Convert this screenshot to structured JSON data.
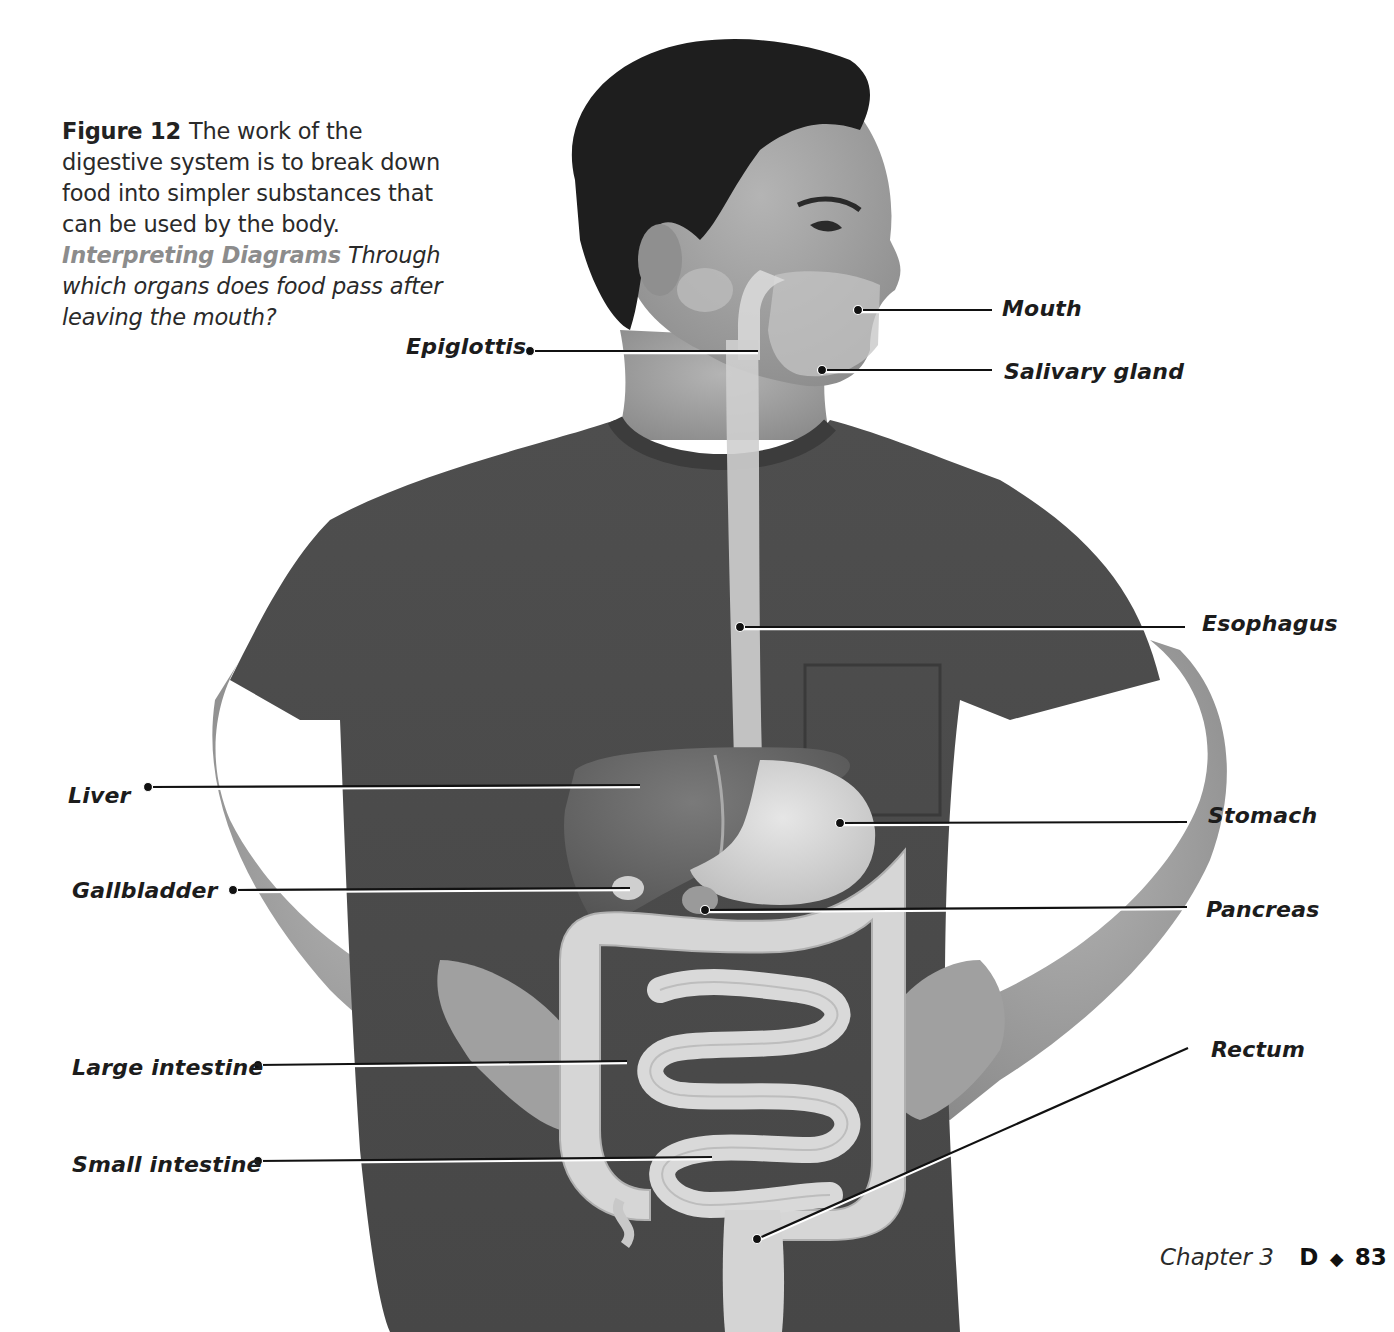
{
  "caption": {
    "figure_number": "Figure 12",
    "text": "The work of the digestive system is to break down food into simpler substances that can be used by the body.",
    "prompt_heading": "Interpreting Diagrams",
    "prompt_text": "Through which organs does food pass after leaving the mouth?"
  },
  "labels": [
    {
      "id": "mouth",
      "text": "Mouth",
      "x": 1002,
      "y": 296,
      "line": {
        "x1": 858,
        "y1": 310,
        "x2": 992,
        "y2": 310
      }
    },
    {
      "id": "epiglottis",
      "text": "Epiglottis",
      "x": 406,
      "y": 334,
      "line": {
        "x1": 530,
        "y1": 351,
        "x2": 758,
        "y2": 351
      }
    },
    {
      "id": "salivary-gland",
      "text": "Salivary gland",
      "x": 1004,
      "y": 359,
      "line": {
        "x1": 822,
        "y1": 370,
        "x2": 992,
        "y2": 370
      }
    },
    {
      "id": "esophagus",
      "text": "Esophagus",
      "x": 1202,
      "y": 611,
      "line": {
        "x1": 740,
        "y1": 627,
        "x2": 1185,
        "y2": 627
      }
    },
    {
      "id": "liver",
      "text": "Liver",
      "x": 68,
      "y": 783,
      "line": {
        "x1": 148,
        "y1": 787,
        "x2": 640,
        "y2": 785
      }
    },
    {
      "id": "stomach",
      "text": "Stomach",
      "x": 1208,
      "y": 803,
      "line": {
        "x1": 840,
        "y1": 823,
        "x2": 1187,
        "y2": 822
      }
    },
    {
      "id": "gallbladder",
      "text": "Gallbladder",
      "x": 72,
      "y": 878,
      "line": {
        "x1": 233,
        "y1": 890,
        "x2": 630,
        "y2": 888
      }
    },
    {
      "id": "pancreas",
      "text": "Pancreas",
      "x": 1206,
      "y": 897,
      "line": {
        "x1": 705,
        "y1": 910,
        "x2": 1187,
        "y2": 907
      }
    },
    {
      "id": "rectum",
      "text": "Rectum",
      "x": 1211,
      "y": 1037,
      "line": {
        "x1": 757,
        "y1": 1239,
        "x2": 1188,
        "y2": 1048
      }
    },
    {
      "id": "large-intestine",
      "text": "Large intestine",
      "x": 72,
      "y": 1055,
      "line": {
        "x1": 258,
        "y1": 1065,
        "x2": 627,
        "y2": 1061
      }
    },
    {
      "id": "small-intestine",
      "text": "Small intestine",
      "x": 72,
      "y": 1152,
      "line": {
        "x1": 258,
        "y1": 1161,
        "x2": 712,
        "y2": 1157
      }
    }
  ],
  "footer": {
    "chapter": "Chapter 3",
    "book_letter": "D",
    "separator": "◆",
    "page_number": "83"
  },
  "colors": {
    "text": "#1c1c1c",
    "prompt_heading": "#8c8c8c",
    "shirt": "#4a4a4a",
    "skin": "#9a9a9a",
    "hair": "#1e1e1e",
    "organ_light": "#d8d8d8",
    "liver": "#5e5e5e"
  }
}
